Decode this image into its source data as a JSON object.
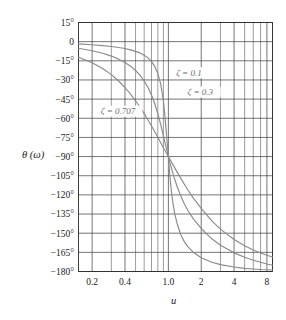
{
  "chart_data": {
    "type": "line",
    "title": "",
    "xlabel": "u",
    "ylabel": "θ (ω)",
    "xscale": "log",
    "yscale": "linear",
    "xlim": [
      0.15,
      9.0
    ],
    "ylim": [
      -180,
      15
    ],
    "grid": true,
    "legend_position": "inline-annotations",
    "xticks": [
      {
        "value": 0.2,
        "label": "0.2"
      },
      {
        "value": 0.4,
        "label": "0.4"
      },
      {
        "value": 1.0,
        "label": "1.0"
      },
      {
        "value": 2.0,
        "label": "2"
      },
      {
        "value": 4.0,
        "label": "4"
      },
      {
        "value": 8.0,
        "label": "8"
      }
    ],
    "x_minor_ticks": [
      0.3,
      0.5,
      0.6,
      0.7,
      0.8,
      0.9,
      3,
      5,
      6,
      7,
      9
    ],
    "yticks": [
      {
        "value": 15,
        "label": "15°"
      },
      {
        "value": 0,
        "label": "0"
      },
      {
        "value": -15,
        "label": "−15°"
      },
      {
        "value": -30,
        "label": "−30°"
      },
      {
        "value": -45,
        "label": "−45°"
      },
      {
        "value": -60,
        "label": "−60°"
      },
      {
        "value": -75,
        "label": "−75°"
      },
      {
        "value": -90,
        "label": "−90°"
      },
      {
        "value": -105,
        "label": "−105°"
      },
      {
        "value": -120,
        "label": "−120°"
      },
      {
        "value": -135,
        "label": "−135°"
      },
      {
        "value": -150,
        "label": "−150°"
      },
      {
        "value": -165,
        "label": "−165°"
      },
      {
        "value": -180,
        "label": "−180°"
      }
    ],
    "series": [
      {
        "name": "zeta-0.1",
        "label": "ζ = 0.1",
        "zeta": 0.1,
        "color": "#8a8a8a",
        "label_x": 1.18,
        "label_y": -26,
        "x": [
          0.15,
          0.2,
          0.25,
          0.3,
          0.35,
          0.4,
          0.45,
          0.5,
          0.55,
          0.6,
          0.65,
          0.7,
          0.75,
          0.8,
          0.85,
          0.9,
          0.93,
          0.95,
          0.97,
          0.99,
          1.0,
          1.01,
          1.03,
          1.05,
          1.07,
          1.1,
          1.15,
          1.2,
          1.3,
          1.4,
          1.5,
          1.7,
          2.0,
          2.5,
          3.0,
          4.0,
          5.0,
          6.0,
          7.0,
          8.0,
          9.0
        ],
        "y": [
          -1.7,
          -2.4,
          -3.1,
          -3.8,
          -4.6,
          -5.4,
          -6.4,
          -7.6,
          -8.8,
          -10.6,
          -12.7,
          -15.6,
          -19.4,
          -25.0,
          -33.1,
          -46.4,
          -58.3,
          -67.7,
          -77.0,
          -84.6,
          -90.0,
          -95.4,
          -104.4,
          -112.0,
          -118.5,
          -126.3,
          -135.7,
          -142.2,
          -151.2,
          -156.6,
          -160.3,
          -165.1,
          -169.3,
          -172.8,
          -174.6,
          -176.5,
          -177.5,
          -178.0,
          -178.4,
          -178.6,
          -178.8
        ]
      },
      {
        "name": "zeta-0.3",
        "label": "ζ = 0.3",
        "zeta": 0.3,
        "color": "#8a8a8a",
        "label_x": 1.5,
        "label_y": -41,
        "x": [
          0.15,
          0.2,
          0.25,
          0.3,
          0.35,
          0.4,
          0.45,
          0.5,
          0.55,
          0.6,
          0.65,
          0.7,
          0.75,
          0.8,
          0.85,
          0.9,
          0.95,
          1.0,
          1.05,
          1.1,
          1.15,
          1.2,
          1.3,
          1.4,
          1.5,
          1.7,
          2.0,
          2.5,
          3.0,
          4.0,
          5.0,
          6.0,
          7.0,
          8.0,
          9.0
        ],
        "y": [
          -5.2,
          -7.1,
          -9.1,
          -11.3,
          -13.7,
          -16.3,
          -19.2,
          -22.6,
          -26.4,
          -30.8,
          -35.9,
          -41.8,
          -48.6,
          -56.3,
          -64.8,
          -73.8,
          -82.3,
          -90.0,
          -97.0,
          -103.1,
          -108.5,
          -113.2,
          -121.0,
          -127.0,
          -131.8,
          -139.0,
          -146.3,
          -154.4,
          -159.4,
          -165.4,
          -168.9,
          -171.2,
          -172.8,
          -174.1,
          -175.1
        ]
      },
      {
        "name": "zeta-0.707",
        "label": "ζ = 0.707",
        "zeta": 0.707,
        "color": "#8a8a8a",
        "label_x": 0.24,
        "label_y": -56,
        "x": [
          0.15,
          0.2,
          0.25,
          0.3,
          0.35,
          0.4,
          0.45,
          0.5,
          0.55,
          0.6,
          0.65,
          0.7,
          0.75,
          0.8,
          0.85,
          0.9,
          0.95,
          1.0,
          1.05,
          1.1,
          1.2,
          1.3,
          1.4,
          1.5,
          1.7,
          2.0,
          2.5,
          3.0,
          4.0,
          5.0,
          6.0,
          7.0,
          8.0,
          9.0
        ],
        "y": [
          -12.2,
          -16.5,
          -21.0,
          -25.8,
          -30.8,
          -35.9,
          -41.1,
          -46.3,
          -51.4,
          -56.4,
          -61.3,
          -66.0,
          -70.5,
          -74.9,
          -79.1,
          -83.1,
          -86.6,
          -90.0,
          -93.2,
          -96.3,
          -102.0,
          -107.1,
          -111.7,
          -115.8,
          -122.7,
          -130.6,
          -140.3,
          -146.8,
          -155.0,
          -159.9,
          -163.2,
          -165.5,
          -167.3,
          -168.6
        ]
      }
    ]
  }
}
